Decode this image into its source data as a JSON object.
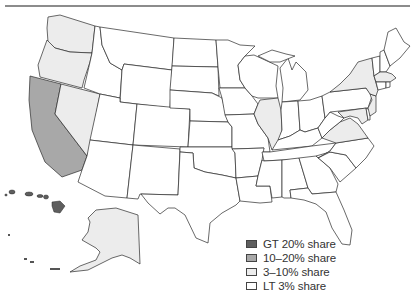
{
  "header": {
    "title_cut": "",
    "rule_color": "#8c8c8c"
  },
  "legend": {
    "items": [
      {
        "label": "GT 20% share",
        "color": "#5e5e5e"
      },
      {
        "label": "10–20% share",
        "color": "#a8a8a8"
      },
      {
        "label": "3–10% share",
        "color": "#ececec"
      },
      {
        "label": "LT 3% share",
        "color": "#ffffff"
      }
    ]
  },
  "map": {
    "categories": {
      "GT 20% share": [
        "HI"
      ],
      "10-20% share": [
        "CA"
      ],
      "3-10% share": [
        "WA",
        "OR",
        "NV",
        "AK",
        "IL",
        "NY",
        "MA",
        "NJ",
        "VA",
        "MD"
      ],
      "LT 3% share": [
        "all other states"
      ]
    }
  }
}
